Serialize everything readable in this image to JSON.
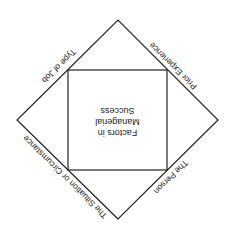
{
  "diagram": {
    "orientation": "rotated 180 degrees",
    "center_box": {
      "lines": [
        "Factors in",
        "Managerial",
        "Success"
      ]
    },
    "edge_labels": {
      "upper_left": "Type of Job",
      "upper_right": "Prior Experience",
      "lower_right": "The Person",
      "lower_left": "The Situation or Circumstance"
    },
    "colors": {
      "line": "#222222",
      "background": "#ffffff"
    }
  }
}
